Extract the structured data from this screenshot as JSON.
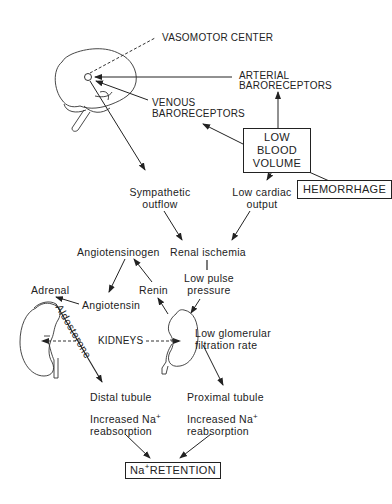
{
  "diagram": {
    "nodes": {
      "vasomotor_center": "VASOMOTOR CENTER",
      "arterial_baroreceptors_1": "ARTERIAL",
      "arterial_baroreceptors_2": "BARORECEPTORS",
      "venous_baroreceptors_1": "VENOUS",
      "venous_baroreceptors_2": "BARORECEPTORS",
      "low_blood_volume_1": "LOW BLOOD",
      "low_blood_volume_2": "VOLUME",
      "hemorrhage": "HEMORRHAGE",
      "sympathetic_outflow_1": "Sympathetic",
      "sympathetic_outflow_2": "outflow",
      "low_cardiac_output_1": "Low cardiac",
      "low_cardiac_output_2": "output",
      "angiotensinogen": "Angiotensinogen",
      "renal_ischemia": "Renal ischemia",
      "low_pulse_pressure_1": "Low pulse",
      "low_pulse_pressure_2": "pressure",
      "adrenal": "Adrenal",
      "angiotensin": "Angiotensin",
      "renin": "Renin",
      "kidneys": "KIDNEYS",
      "aldosterone": "Aldosterone",
      "low_gfr_1": "Low glomerular",
      "low_gfr_2": "filtration rate",
      "distal_tubule": "Distal tubule",
      "proximal_tubule": "Proximal tubule",
      "increased_na_left_1": "Increased Na",
      "increased_na_left_2": "reabsorption",
      "increased_na_right_1": "Increased Na",
      "increased_na_right_2": "reabsorption",
      "na_superscript": "+",
      "na_retention_prefix": "Na",
      "na_retention_suffix": "RETENTION"
    },
    "icons": [
      "brain-icon",
      "kidney-left-icon",
      "kidney-right-icon"
    ],
    "colors": {
      "ink": "#222222",
      "background": "#ffffff"
    }
  }
}
